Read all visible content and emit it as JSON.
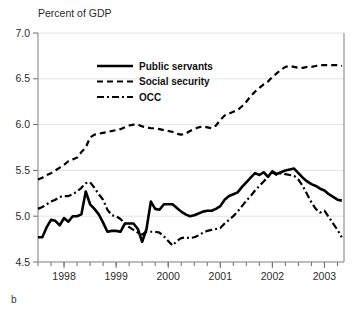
{
  "figure": {
    "panel_label": "b",
    "axis_title": "Percent of GDP"
  },
  "legend": {
    "position": "upper-left-inside",
    "entries": [
      {
        "label": "Public servants",
        "style": "solid-thick",
        "color": "#000000"
      },
      {
        "label": "Social security",
        "style": "dashed",
        "color": "#000000"
      },
      {
        "label": "OCC",
        "style": "dash-dot",
        "color": "#000000"
      }
    ]
  },
  "chart_data": {
    "type": "line",
    "title": "",
    "subtitle": "",
    "xlabel": "",
    "ylabel": "Percent of GDP",
    "ylim": [
      4.5,
      7.0
    ],
    "yticks": [
      "4.5",
      "5.0",
      "5.5",
      "6.0",
      "6.5",
      "7.0"
    ],
    "ytick_values": [
      4.5,
      5.0,
      5.5,
      6.0,
      6.5,
      7.0
    ],
    "xlim": [
      1997.5,
      2003.375
    ],
    "xticks": [
      "1998",
      "1999",
      "2000",
      "2001",
      "2002",
      "2003"
    ],
    "xtick_values": [
      1998,
      1999,
      2000,
      2001,
      2002,
      2003
    ],
    "x_minor_interval": 0.25,
    "grid": true,
    "grid_axis": "y",
    "legend_position": "upper left",
    "x": [
      1997.5,
      1997.583,
      1997.667,
      1997.75,
      1997.833,
      1997.917,
      1998.0,
      1998.083,
      1998.167,
      1998.25,
      1998.333,
      1998.417,
      1998.5,
      1998.583,
      1998.667,
      1998.75,
      1998.833,
      1998.917,
      1999.0,
      1999.083,
      1999.167,
      1999.25,
      1999.333,
      1999.417,
      1999.5,
      1999.583,
      1999.667,
      1999.75,
      1999.833,
      1999.917,
      2000.0,
      2000.083,
      2000.167,
      2000.25,
      2000.333,
      2000.417,
      2000.5,
      2000.583,
      2000.667,
      2000.75,
      2000.833,
      2000.917,
      2001.0,
      2001.083,
      2001.167,
      2001.25,
      2001.333,
      2001.417,
      2001.5,
      2001.583,
      2001.667,
      2001.75,
      2001.833,
      2001.917,
      2002.0,
      2002.083,
      2002.167,
      2002.25,
      2002.333,
      2002.417,
      2002.5,
      2002.583,
      2002.667,
      2002.75,
      2002.833,
      2002.917,
      2003.0,
      2003.083,
      2003.167,
      2003.25,
      2003.333
    ],
    "series": [
      {
        "name": "Public servants",
        "style": "solid-thick",
        "values": [
          4.77,
          4.77,
          4.88,
          4.96,
          4.95,
          4.9,
          4.98,
          4.94,
          5.0,
          5.0,
          5.02,
          5.27,
          5.13,
          5.08,
          5.02,
          4.93,
          4.83,
          4.84,
          4.84,
          4.83,
          4.92,
          4.92,
          4.92,
          4.86,
          4.72,
          4.86,
          5.16,
          5.08,
          5.07,
          5.13,
          5.13,
          5.13,
          5.09,
          5.05,
          5.02,
          5.0,
          5.01,
          5.03,
          5.05,
          5.06,
          5.06,
          5.08,
          5.11,
          5.18,
          5.22,
          5.24,
          5.26,
          5.32,
          5.37,
          5.42,
          5.47,
          5.45,
          5.48,
          5.43,
          5.49,
          5.46,
          5.48,
          5.5,
          5.51,
          5.52,
          5.47,
          5.42,
          5.38,
          5.35,
          5.33,
          5.3,
          5.28,
          5.24,
          5.21,
          5.18,
          5.17
        ]
      },
      {
        "name": "Social security",
        "style": "dashed",
        "values": [
          5.4,
          5.42,
          5.45,
          5.47,
          5.5,
          5.53,
          5.56,
          5.6,
          5.62,
          5.64,
          5.7,
          5.75,
          5.86,
          5.89,
          5.9,
          5.91,
          5.92,
          5.93,
          5.94,
          5.95,
          5.97,
          5.99,
          6.0,
          6.0,
          5.98,
          5.97,
          5.96,
          5.96,
          5.95,
          5.94,
          5.93,
          5.92,
          5.9,
          5.89,
          5.9,
          5.93,
          5.95,
          5.97,
          5.98,
          5.97,
          5.96,
          5.99,
          6.05,
          6.1,
          6.12,
          6.14,
          6.16,
          6.2,
          6.25,
          6.31,
          6.36,
          6.4,
          6.44,
          6.47,
          6.52,
          6.56,
          6.6,
          6.63,
          6.64,
          6.63,
          6.62,
          6.62,
          6.63,
          6.63,
          6.64,
          6.65,
          6.65,
          6.65,
          6.65,
          6.65,
          6.64
        ]
      },
      {
        "name": "OCC",
        "style": "dash-dot",
        "values": [
          5.08,
          5.1,
          5.13,
          5.16,
          5.18,
          5.21,
          5.22,
          5.22,
          5.24,
          5.27,
          5.31,
          5.36,
          5.37,
          5.31,
          5.24,
          5.18,
          5.07,
          5.01,
          5.0,
          4.97,
          4.92,
          4.88,
          4.85,
          4.82,
          4.8,
          4.83,
          4.83,
          4.83,
          4.82,
          4.78,
          4.73,
          4.68,
          4.73,
          4.76,
          4.77,
          4.76,
          4.77,
          4.79,
          4.82,
          4.84,
          4.85,
          4.86,
          4.87,
          4.92,
          4.96,
          5.0,
          5.05,
          5.11,
          5.17,
          5.22,
          5.28,
          5.33,
          5.38,
          5.43,
          5.48,
          5.45,
          5.47,
          5.46,
          5.45,
          5.44,
          5.4,
          5.33,
          5.24,
          5.15,
          5.08,
          5.04,
          5.06,
          4.99,
          4.92,
          4.85,
          4.77
        ]
      }
    ]
  }
}
